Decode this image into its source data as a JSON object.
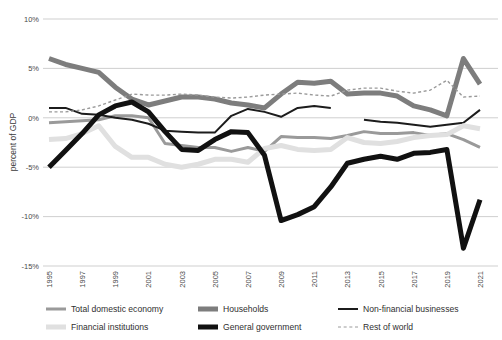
{
  "axis": {
    "ylabel": "percent of GDP",
    "yticks": [
      "10%",
      "5%",
      "0%",
      "-5%",
      "-10%",
      "-15%"
    ],
    "ytick_values": [
      10,
      5,
      0,
      -5,
      -10,
      -15
    ],
    "xticks": [
      "1995",
      "1997",
      "1999",
      "2001",
      "2003",
      "2005",
      "2007",
      "2009",
      "2011",
      "2013",
      "2015",
      "2017",
      "2019",
      "2021"
    ]
  },
  "legend": {
    "rows": [
      [
        {
          "label": "Total domestic economy",
          "key": "total_domestic_economy",
          "color": "#9a9a9a",
          "width": 3.0,
          "dash": "none"
        },
        {
          "label": "Households",
          "key": "households",
          "color": "#7d7d7d",
          "width": 5.0,
          "dash": "none"
        },
        {
          "label": "Non-financial businesses",
          "key": "non_financial_businesses",
          "color": "#1c1c1c",
          "width": 2.0,
          "dash": "none"
        }
      ],
      [
        {
          "label": "Financial institutions",
          "key": "financial_institutions",
          "color": "#e0e0e0",
          "width": 5.0,
          "dash": "none"
        },
        {
          "label": "General government",
          "key": "general_government",
          "color": "#111111",
          "width": 5.0,
          "dash": "none"
        },
        {
          "label": "Rest of world",
          "key": "rest_of_world",
          "color": "#9a9a9a",
          "width": 1.4,
          "dash": "3,2.5"
        }
      ]
    ]
  },
  "chart_data": {
    "type": "line",
    "title": "",
    "xlabel": "",
    "ylabel": "percent of GDP",
    "xlim": [
      1995,
      2021
    ],
    "ylim": [
      -15,
      10
    ],
    "grid": "horizontal",
    "legend_position": "bottom",
    "x": [
      1995,
      1996,
      1997,
      1998,
      1999,
      2000,
      2001,
      2002,
      2003,
      2004,
      2005,
      2006,
      2007,
      2008,
      2009,
      2010,
      2011,
      2012,
      2013,
      2014,
      2015,
      2016,
      2017,
      2018,
      2019,
      2020,
      2021
    ],
    "series": [
      {
        "name": "Total domestic economy",
        "color": "#9a9a9a",
        "width": 3.0,
        "dash": "none",
        "values": [
          -0.5,
          -0.4,
          -0.3,
          -0.2,
          0.2,
          0.2,
          0.0,
          -2.6,
          -2.8,
          -3.0,
          -3.0,
          -3.4,
          -3.0,
          -3.4,
          -1.9,
          -2.0,
          -2.0,
          -2.1,
          -1.8,
          -1.4,
          -1.6,
          -1.6,
          -1.5,
          -1.8,
          -1.6,
          -2.2,
          -3.0
        ]
      },
      {
        "name": "Households",
        "color": "#7d7d7d",
        "width": 5.0,
        "dash": "none",
        "values": [
          6.0,
          5.4,
          5.0,
          4.6,
          3.1,
          1.9,
          1.3,
          1.7,
          2.1,
          2.1,
          1.9,
          1.5,
          1.3,
          1.0,
          2.4,
          3.6,
          3.5,
          3.7,
          2.4,
          2.5,
          2.5,
          2.2,
          1.2,
          0.8,
          0.2,
          6.0,
          3.4
        ]
      },
      {
        "name": "Non-financial businesses",
        "color": "#1c1c1c",
        "width": 2.0,
        "dash": "none",
        "values": [
          1.0,
          1.0,
          0.4,
          0.3,
          0.0,
          -0.2,
          -0.6,
          -1.3,
          -1.4,
          -1.5,
          -1.5,
          0.2,
          0.9,
          0.6,
          0.1,
          1.0,
          1.2,
          1.0,
          null,
          -0.2,
          -0.4,
          -0.5,
          -0.7,
          -0.9,
          -0.7,
          -0.5,
          0.8
        ]
      },
      {
        "name": "Financial institutions",
        "color": "#e0e0e0",
        "width": 5.0,
        "dash": "none",
        "values": [
          -2.2,
          -2.1,
          -1.6,
          -0.8,
          -2.9,
          -4.0,
          -4.0,
          -4.7,
          -5.0,
          -4.7,
          -4.2,
          -4.2,
          -4.5,
          -3.1,
          -2.8,
          -3.2,
          -3.3,
          -3.2,
          -2.0,
          -2.5,
          -2.6,
          -2.4,
          -2.0,
          -1.8,
          -1.7,
          -0.8,
          -1.1
        ]
      },
      {
        "name": "General government",
        "color": "#111111",
        "width": 5.0,
        "dash": "none",
        "values": [
          -5.0,
          -3.3,
          -1.6,
          0.3,
          1.2,
          1.6,
          0.6,
          -1.4,
          -3.2,
          -3.3,
          -2.2,
          -1.4,
          -1.5,
          -3.8,
          -10.4,
          -9.8,
          -9.0,
          -7.0,
          -4.6,
          -4.2,
          -3.9,
          -4.2,
          -3.6,
          -3.5,
          -3.2,
          -13.2,
          -8.3
        ]
      },
      {
        "name": "Rest of world",
        "color": "#9a9a9a",
        "width": 1.4,
        "dash": "3,2.5",
        "values": [
          0.6,
          0.6,
          0.8,
          1.2,
          1.8,
          2.4,
          2.3,
          2.3,
          2.4,
          2.3,
          2.1,
          2.0,
          2.1,
          2.3,
          2.4,
          2.5,
          2.3,
          2.2,
          2.8,
          3.0,
          3.0,
          2.7,
          2.5,
          2.8,
          3.8,
          2.1,
          2.2
        ]
      }
    ]
  }
}
